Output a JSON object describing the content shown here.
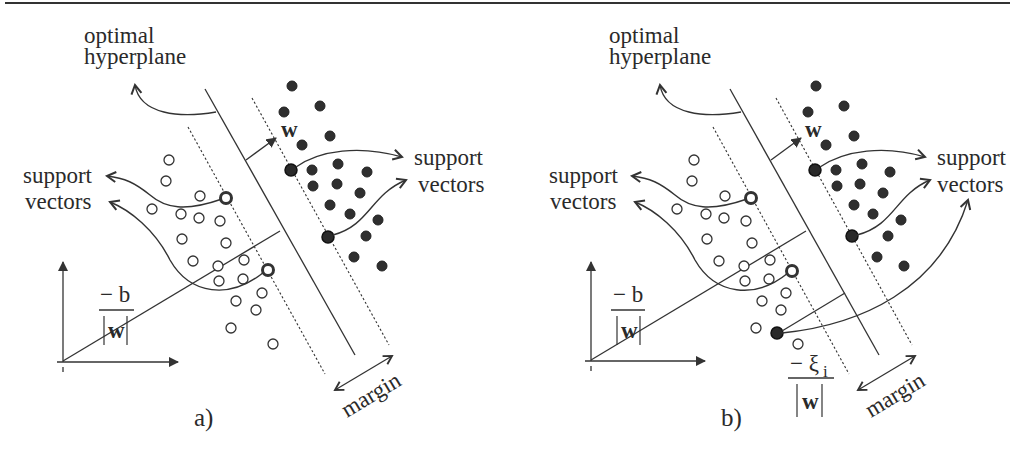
{
  "figure": {
    "panels": [
      {
        "id": "a",
        "caption": "a)",
        "labels": {
          "hyperplane_line1": "optimal",
          "hyperplane_line2": "hyperplane",
          "sv_left_line1": "support",
          "sv_left_line2": "vectors",
          "sv_right_line1": "support",
          "sv_right_line2": "vectors",
          "w_vector": "w",
          "bias_numerator": "− b",
          "bias_denominator": "w",
          "margin": "margin"
        }
      },
      {
        "id": "b",
        "caption": "b)",
        "labels": {
          "hyperplane_line1": "optimal",
          "hyperplane_line2": "hyperplane",
          "sv_left_line1": "support",
          "sv_left_line2": "vectors",
          "sv_right_line1": "support",
          "sv_right_line2": "vectors",
          "w_vector": "w",
          "bias_numerator": "− b",
          "bias_denominator": "w",
          "slack_numerator": "− ξ",
          "slack_subscript": "i",
          "slack_denominator": "w",
          "margin": "margin"
        }
      }
    ],
    "legend": {
      "open_circle": "class −1 sample",
      "filled_circle": "class +1 sample"
    },
    "colors": {
      "ink": "#2f2f2f",
      "background": "#ffffff"
    }
  }
}
